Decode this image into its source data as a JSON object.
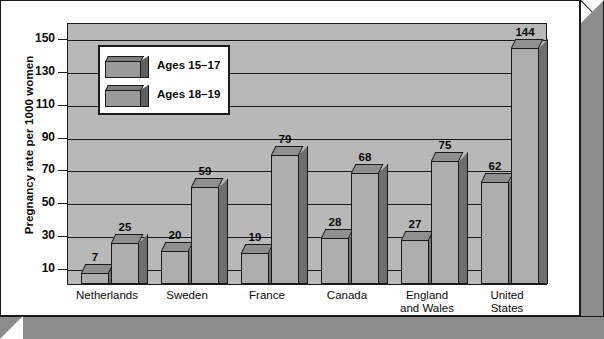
{
  "chart_data": {
    "type": "bar",
    "title": "",
    "xlabel": "",
    "ylabel": "Pregnancy rate per 1000 women",
    "ylim": [
      0,
      160
    ],
    "yticks": [
      10,
      30,
      50,
      70,
      90,
      110,
      130,
      150
    ],
    "grid": true,
    "legend_position": "upper-left-inside",
    "categories": [
      "Netherlands",
      "Sweden",
      "France",
      "Canada",
      "England and Wales",
      "United States"
    ],
    "series": [
      {
        "name": "Ages 15–17",
        "values": [
          7,
          20,
          19,
          28,
          27,
          62
        ]
      },
      {
        "name": "Ages 18–19",
        "values": [
          25,
          59,
          79,
          68,
          75,
          144
        ]
      }
    ]
  },
  "axis": {
    "y_title": "Pregnancy rate per 1000 women",
    "tick_labels": [
      "150",
      "130",
      "110",
      "90",
      "70",
      "50",
      "30",
      "10"
    ]
  },
  "legend": {
    "entries": [
      {
        "label": "Ages 15–17"
      },
      {
        "label": "Ages 18–19"
      }
    ]
  },
  "categories": [
    {
      "line1": "Netherlands",
      "line2": ""
    },
    {
      "line1": "Sweden",
      "line2": ""
    },
    {
      "line1": "France",
      "line2": ""
    },
    {
      "line1": "Canada",
      "line2": ""
    },
    {
      "line1": "England",
      "line2": "and Wales"
    },
    {
      "line1": "United",
      "line2": "States"
    }
  ],
  "values": {
    "netherlands_15_17": "7",
    "netherlands_18_19": "25",
    "sweden_15_17": "20",
    "sweden_18_19": "59",
    "france_15_17": "19",
    "france_18_19": "79",
    "canada_15_17": "28",
    "canada_18_19": "68",
    "england_15_17": "27",
    "england_18_19": "75",
    "us_15_17": "62",
    "us_18_19": "144"
  },
  "colors": {
    "plot_background": "#b8b8b8",
    "bar_front": "#adadad",
    "bar_side": "#6e6e6e",
    "frame": "#8c8c8c",
    "outline": "#1a1a1a"
  }
}
